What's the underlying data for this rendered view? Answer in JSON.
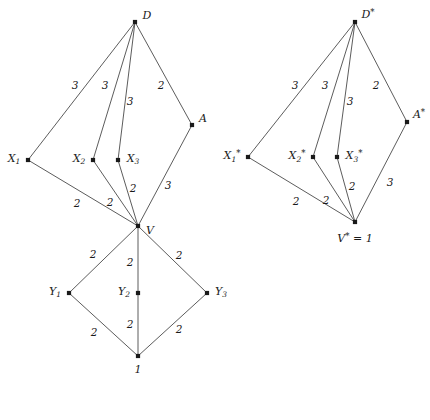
{
  "figure": {
    "type": "diagram",
    "background_color": "#ffffff",
    "node_color": "#1a1a1a",
    "edge_color": "#4a4a4a"
  },
  "graphs": [
    {
      "id": "left-graph",
      "name": "original-graph",
      "nodes": [
        {
          "id": "D",
          "label_html": "D",
          "label_plain": "D",
          "x": 135,
          "y": 22,
          "lx": 147,
          "ly": 15
        },
        {
          "id": "X1",
          "label_html": "X<sub>1</sub>",
          "label_plain": "X1",
          "x": 28,
          "y": 160,
          "lx": 14,
          "ly": 159
        },
        {
          "id": "X2",
          "label_html": "X<sub>2</sub>",
          "label_plain": "X2",
          "x": 93,
          "y": 160,
          "lx": 79,
          "ly": 159
        },
        {
          "id": "X3",
          "label_html": "X<sub>3</sub>",
          "label_plain": "X3",
          "x": 118,
          "y": 160,
          "lx": 133,
          "ly": 159
        },
        {
          "id": "A",
          "label_html": "A",
          "label_plain": "A",
          "x": 192,
          "y": 125,
          "lx": 203,
          "ly": 118
        },
        {
          "id": "V",
          "label_html": "V",
          "label_plain": "V",
          "x": 138,
          "y": 226,
          "lx": 150,
          "ly": 230
        },
        {
          "id": "Y1",
          "label_html": "Y<sub>1</sub>",
          "label_plain": "Y1",
          "x": 69,
          "y": 293,
          "lx": 55,
          "ly": 292
        },
        {
          "id": "Y2",
          "label_html": "Y<sub>2</sub>",
          "label_plain": "Y2",
          "x": 138,
          "y": 293,
          "lx": 124,
          "ly": 292
        },
        {
          "id": "Y3",
          "label_html": "Y<sub>3</sub>",
          "label_plain": "Y3",
          "x": 207,
          "y": 293,
          "lx": 221,
          "ly": 292
        },
        {
          "id": "ONE",
          "label_html": "1",
          "label_plain": "1",
          "x": 138,
          "y": 356,
          "lx": 138,
          "ly": 369
        }
      ],
      "edges": [
        {
          "from": "D",
          "to": "X1",
          "weight": "3",
          "lx": 75,
          "ly": 85
        },
        {
          "from": "D",
          "to": "X2",
          "weight": "3",
          "lx": 105,
          "ly": 85
        },
        {
          "from": "D",
          "to": "X3",
          "weight": "3",
          "lx": 130,
          "ly": 101
        },
        {
          "from": "D",
          "to": "A",
          "weight": "2",
          "lx": 161,
          "ly": 85
        },
        {
          "from": "X1",
          "to": "V",
          "weight": "2",
          "lx": 77,
          "ly": 203
        },
        {
          "from": "X2",
          "to": "V",
          "weight": "2",
          "lx": 110,
          "ly": 202
        },
        {
          "from": "X3",
          "to": "V",
          "weight": "2",
          "lx": 133,
          "ly": 188
        },
        {
          "from": "A",
          "to": "V",
          "weight": "3",
          "lx": 168,
          "ly": 185
        },
        {
          "from": "V",
          "to": "Y1",
          "weight": "2",
          "lx": 93,
          "ly": 254
        },
        {
          "from": "V",
          "to": "Y2",
          "weight": "2",
          "lx": 130,
          "ly": 262
        },
        {
          "from": "V",
          "to": "Y3",
          "weight": "2",
          "lx": 179,
          "ly": 255
        },
        {
          "from": "Y1",
          "to": "ONE",
          "weight": "2",
          "lx": 94,
          "ly": 332
        },
        {
          "from": "Y2",
          "to": "ONE",
          "weight": "2",
          "lx": 130,
          "ly": 324
        },
        {
          "from": "Y3",
          "to": "ONE",
          "weight": "2",
          "lx": 179,
          "ly": 329
        }
      ]
    },
    {
      "id": "right-graph",
      "name": "starred-graph",
      "nodes": [
        {
          "id": "Ds",
          "label_html": "D<star>*</star>",
          "label_plain": "D*",
          "x": 355,
          "y": 22,
          "lx": 368,
          "ly": 14
        },
        {
          "id": "X1s",
          "label_html": "X<sub>1</sub><star>*</star>",
          "label_plain": "X1*",
          "x": 248,
          "y": 157,
          "lx": 232,
          "ly": 156
        },
        {
          "id": "X2s",
          "label_html": "X<sub>2</sub><star>*</star>",
          "label_plain": "X2*",
          "x": 313,
          "y": 157,
          "lx": 297,
          "ly": 156
        },
        {
          "id": "X3s",
          "label_html": "X<sub>3</sub><star>*</star>",
          "label_plain": "X3*",
          "x": 337,
          "y": 157,
          "lx": 354,
          "ly": 156
        },
        {
          "id": "As",
          "label_html": "A<star>*</star>",
          "label_plain": "A*",
          "x": 407,
          "y": 122,
          "lx": 419,
          "ly": 114
        },
        {
          "id": "Vs",
          "label_html": "V<star>*</star> = 1",
          "label_plain": "V* = 1",
          "x": 355,
          "y": 222,
          "lx": 355,
          "ly": 238
        }
      ],
      "edges": [
        {
          "from": "Ds",
          "to": "X1s",
          "weight": "3",
          "lx": 295,
          "ly": 85
        },
        {
          "from": "Ds",
          "to": "X2s",
          "weight": "3",
          "lx": 325,
          "ly": 85
        },
        {
          "from": "Ds",
          "to": "X3s",
          "weight": "3",
          "lx": 350,
          "ly": 101
        },
        {
          "from": "Ds",
          "to": "As",
          "weight": "2",
          "lx": 376,
          "ly": 85
        },
        {
          "from": "X1s",
          "to": "Vs",
          "weight": "2",
          "lx": 296,
          "ly": 201
        },
        {
          "from": "X2s",
          "to": "Vs",
          "weight": "2",
          "lx": 326,
          "ly": 200
        },
        {
          "from": "X3s",
          "to": "Vs",
          "weight": "2",
          "lx": 352,
          "ly": 186
        },
        {
          "from": "As",
          "to": "Vs",
          "weight": "3",
          "lx": 390,
          "ly": 182
        }
      ]
    }
  ]
}
